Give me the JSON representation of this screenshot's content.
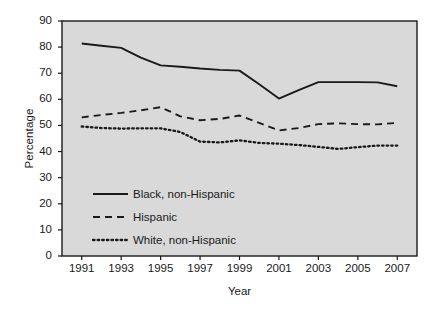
{
  "chart_data": {
    "type": "line",
    "title": "",
    "xlabel": "Year",
    "ylabel": "Percentage",
    "xlim": [
      1990,
      2008
    ],
    "ylim": [
      0,
      90
    ],
    "yticks": [
      0,
      10,
      20,
      30,
      40,
      50,
      60,
      70,
      80,
      90
    ],
    "xticks": [
      1991,
      1993,
      1995,
      1997,
      1999,
      2001,
      2003,
      2005,
      2007
    ],
    "grid": false,
    "legend_position": "lower-left-inside",
    "plot_background": "#d9d9d9",
    "page_background": "#ffffff",
    "line_color": "#1a1a1a",
    "x": [
      1991,
      1992,
      1993,
      1994,
      1995,
      1996,
      1997,
      1998,
      1999,
      2000,
      2001,
      2002,
      2003,
      2004,
      2005,
      2006,
      2007
    ],
    "series": [
      {
        "name": "Black, non-Hispanic",
        "style": "solid",
        "values": [
          81.4,
          80.5,
          79.7,
          76.0,
          73.0,
          72.5,
          71.8,
          71.3,
          71.0,
          65.8,
          60.3,
          63.5,
          66.6,
          66.6,
          66.6,
          66.5,
          65.0
        ]
      },
      {
        "name": "Hispanic",
        "style": "dashed",
        "values": [
          53.1,
          54.0,
          54.8,
          55.8,
          57.0,
          53.5,
          52.0,
          52.5,
          53.8,
          51.0,
          48.1,
          49.0,
          50.5,
          50.8,
          50.5,
          50.4,
          51.0
        ]
      },
      {
        "name": "White, non-Hispanic",
        "style": "dotted",
        "values": [
          49.6,
          49.0,
          48.8,
          48.9,
          48.9,
          47.5,
          43.8,
          43.5,
          44.3,
          43.3,
          43.0,
          42.5,
          41.8,
          41.0,
          41.7,
          42.3,
          42.3
        ]
      }
    ],
    "legend": [
      {
        "label": "Black, non-Hispanic",
        "style": "solid"
      },
      {
        "label": "Hispanic",
        "style": "dashed"
      },
      {
        "label": "White, non-Hispanic",
        "style": "dotted"
      }
    ]
  },
  "axis": {
    "y_tick_labels": [
      "90",
      "80",
      "70",
      "60",
      "50",
      "40",
      "30",
      "20",
      "10",
      "0"
    ],
    "x_tick_labels": [
      "1991",
      "1993",
      "1995",
      "1997",
      "1999",
      "2001",
      "2003",
      "2005",
      "2007"
    ],
    "ylabel": "Percentage",
    "xlabel": "Year"
  },
  "legend": {
    "items": [
      {
        "label": "Black, non-Hispanic"
      },
      {
        "label": "Hispanic"
      },
      {
        "label": "White, non-Hispanic"
      }
    ]
  }
}
